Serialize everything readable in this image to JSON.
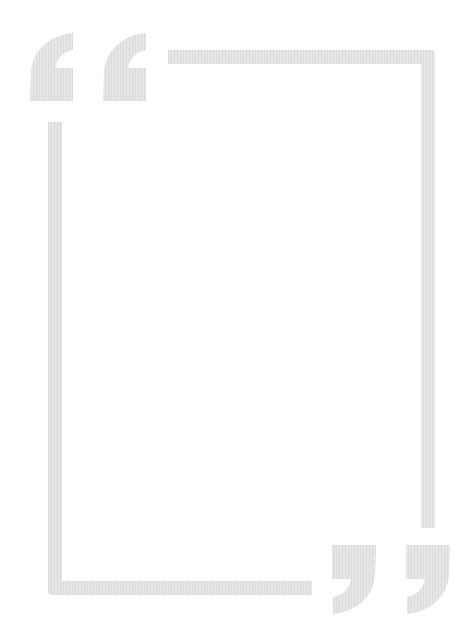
{
  "frame": {
    "color": "#e3e3e3",
    "open_quote_icon": "left-double-quote-icon",
    "close_quote_icon": "right-double-quote-icon",
    "content_text": ""
  }
}
